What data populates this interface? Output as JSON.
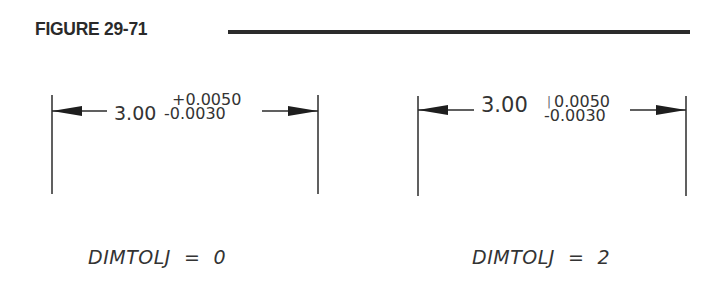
{
  "figure": {
    "title": "FIGURE 29-71"
  },
  "panels": [
    {
      "id": "left",
      "basic_value": "3.00",
      "upper_tolerance": "+0.0050",
      "lower_tolerance": "-0.0030",
      "caption": "DIMTOLJ  =  0"
    },
    {
      "id": "right",
      "basic_value": "3.00",
      "separator": "|",
      "upper_tolerance": "0.0050",
      "lower_tolerance": "-0.0030",
      "caption": "DIMTOLJ  =  2"
    }
  ],
  "colors": {
    "line": "#2b2b2b",
    "text": "#333333",
    "background": "#ffffff"
  }
}
